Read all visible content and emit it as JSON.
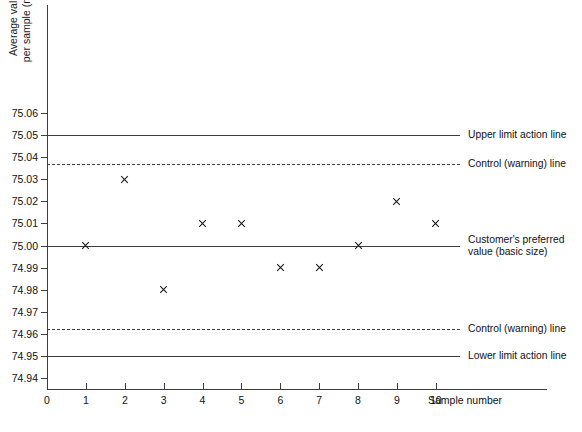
{
  "chart_data": {
    "type": "scatter",
    "title": "",
    "xlabel": "Sample number",
    "ylabel": "Average value per sample (mm)",
    "ylabel_lines": [
      "Average value",
      "per sample (mm)"
    ],
    "x": [
      1,
      2,
      3,
      4,
      5,
      6,
      7,
      8,
      9,
      10
    ],
    "values": [
      75.0,
      75.03,
      74.98,
      75.01,
      75.01,
      74.99,
      74.99,
      75.0,
      75.02,
      75.01
    ],
    "series": [
      {
        "name": "Sample averages",
        "marker": "x",
        "values": [
          75.0,
          75.03,
          74.98,
          75.01,
          75.01,
          74.99,
          74.99,
          75.0,
          75.02,
          75.01
        ]
      }
    ],
    "xlim": [
      0,
      11.6
    ],
    "ylim": [
      74.935,
      75.067
    ],
    "xticks": [
      "0",
      "1",
      "2",
      "3",
      "4",
      "5",
      "6",
      "7",
      "8",
      "9",
      "10"
    ],
    "yticks": [
      "75.06",
      "75.05",
      "75.04",
      "75.03",
      "75.02",
      "75.01",
      "75.00",
      "74.99",
      "74.98",
      "74.97",
      "74.96",
      "74.95",
      "74.94"
    ],
    "ytick_values": [
      75.06,
      75.05,
      75.04,
      75.03,
      75.02,
      75.01,
      75.0,
      74.99,
      74.98,
      74.97,
      74.96,
      74.95,
      74.94
    ],
    "grid": false,
    "legend": "none",
    "reference_lines": [
      {
        "id": "upper-action",
        "value": 75.05,
        "style": "solid",
        "label_lines": [
          "Upper limit action line"
        ]
      },
      {
        "id": "upper-warning",
        "value": 75.037,
        "style": "dashed",
        "label_lines": [
          "Control (warning) line"
        ]
      },
      {
        "id": "preferred",
        "value": 75.0,
        "style": "solid",
        "label_lines": [
          "Customer's preferred",
          "value (basic size)"
        ]
      },
      {
        "id": "lower-warning",
        "value": 74.962,
        "style": "dashed",
        "label_lines": [
          "Control (warning) line"
        ]
      },
      {
        "id": "lower-action",
        "value": 74.95,
        "style": "solid",
        "label_lines": [
          "Lower limit action line"
        ]
      }
    ],
    "colors": {
      "axis": "#3d3d3d",
      "line": "#3d3d3d",
      "marker": "#1a1a1a",
      "text": "#111111",
      "background": "#ffffff"
    }
  }
}
